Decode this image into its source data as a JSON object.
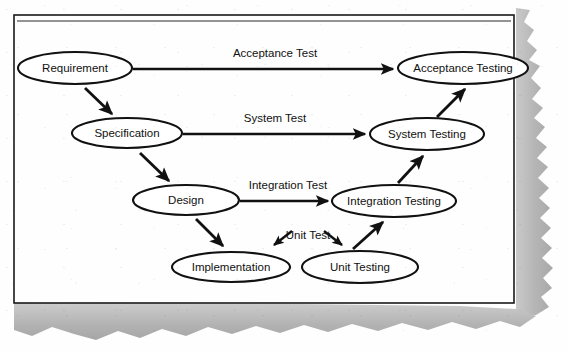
{
  "document": {
    "kind": "scanned-page",
    "diagram_title": "V-Model",
    "page_background": "#fefefe",
    "torn_edge_color": "#b6b6b6",
    "frame_color": "#1a1a1a",
    "ink_color": "#111111"
  },
  "nodes": {
    "development": [
      {
        "id": "requirement",
        "label": "Requirement",
        "cx": 75,
        "cy": 68,
        "rx": 57,
        "ry": 16
      },
      {
        "id": "specification",
        "label": "Specification",
        "cx": 127,
        "cy": 133,
        "rx": 55,
        "ry": 15
      },
      {
        "id": "design",
        "label": "Design",
        "cx": 186,
        "cy": 200,
        "rx": 53,
        "ry": 15
      },
      {
        "id": "implementation",
        "label": "Implementation",
        "cx": 231,
        "cy": 267,
        "rx": 59,
        "ry": 15
      }
    ],
    "testing": [
      {
        "id": "unit-testing",
        "label": "Unit Testing",
        "cx": 360,
        "cy": 267,
        "rx": 58,
        "ry": 16
      },
      {
        "id": "integration-testing",
        "label": "Integration Testing",
        "cx": 394,
        "cy": 201,
        "rx": 62,
        "ry": 16
      },
      {
        "id": "system-testing",
        "label": "System Testing",
        "cx": 427,
        "cy": 134,
        "rx": 57,
        "ry": 16
      },
      {
        "id": "acceptance-testing",
        "label": "Acceptance Testing",
        "cx": 463,
        "cy": 68,
        "rx": 65,
        "ry": 16
      }
    ]
  },
  "verification_edges": [
    {
      "id": "acceptance-test",
      "label": "Acceptance Test",
      "label_x": 275,
      "label_y": 57,
      "x1": 133,
      "y1": 69,
      "x2": 396,
      "y2": 69
    },
    {
      "id": "system-test",
      "label": "System Test",
      "label_x": 275,
      "label_y": 122,
      "x1": 183,
      "y1": 134,
      "x2": 368,
      "y2": 134
    },
    {
      "id": "integration-test",
      "label": "Integration Test",
      "label_x": 288,
      "label_y": 189,
      "x1": 240,
      "y1": 201,
      "x2": 330,
      "y2": 201
    },
    {
      "id": "unit-test",
      "label": "Unit Test",
      "label_x": 300,
      "label_y": 240,
      "x1": 0,
      "y1": 0,
      "x2": 0,
      "y2": 0
    }
  ],
  "flow_arrows": [
    {
      "id": "requirement-to-specification",
      "x1": 85,
      "y1": 88,
      "x2": 113,
      "y2": 115
    },
    {
      "id": "specification-to-design",
      "x1": 140,
      "y1": 154,
      "x2": 170,
      "y2": 182
    },
    {
      "id": "design-to-implementation",
      "x1": 196,
      "y1": 219,
      "x2": 224,
      "y2": 247
    },
    {
      "id": "unit-testing-to-integration-testing",
      "x1": 355,
      "y1": 248,
      "x2": 384,
      "y2": 221
    },
    {
      "id": "integration-testing-to-system-testing",
      "x1": 399,
      "y1": 182,
      "x2": 424,
      "y2": 155
    },
    {
      "id": "system-testing-to-acceptance-testing",
      "x1": 437,
      "y1": 116,
      "x2": 466,
      "y2": 88
    },
    {
      "id": "unit-test-left-arrow",
      "x1": 290,
      "y1": 232,
      "x2": 272,
      "y2": 246
    },
    {
      "id": "unit-test-right-arrow",
      "x1": 325,
      "y1": 232,
      "x2": 343,
      "y2": 246
    }
  ],
  "frame": {
    "x": 14,
    "y": 15,
    "width": 500,
    "height": 288
  }
}
